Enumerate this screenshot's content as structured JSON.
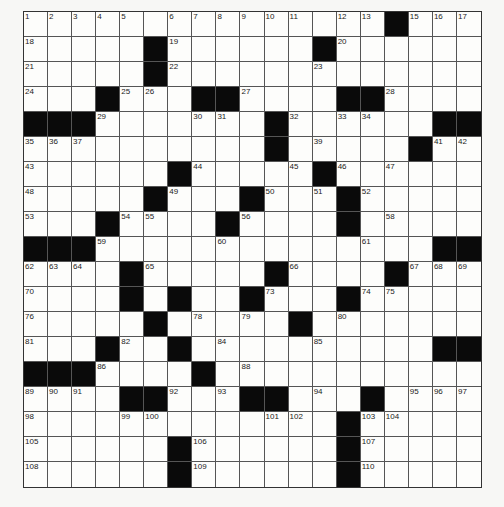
{
  "puzzle": {
    "cols": 19,
    "rows": 19,
    "grid": [
      "...............#...",
      ".....#......#......",
      ".....#.............",
      "...#...##....##....",
      "###.......#......##",
      "..........#.....#..",
      "......#.....#......",
      ".....#...#...#.....",
      "...#....#....#.....",
      "###..............##",
      "....#.....#....#...",
      "....#.#..#...#.....",
      ".....#.....#.......",
      "...#..#..........##",
      "###....#...........",
      "....##...##...#....",
      ".............#.....",
      "......#......#.....",
      "......#......#....."
    ],
    "numbers": [
      [
        1,
        0,
        0
      ],
      [
        2,
        0,
        1
      ],
      [
        3,
        0,
        2
      ],
      [
        4,
        0,
        3
      ],
      [
        5,
        0,
        4
      ],
      [
        6,
        0,
        6
      ],
      [
        7,
        0,
        7
      ],
      [
        8,
        0,
        8
      ],
      [
        9,
        0,
        9
      ],
      [
        10,
        0,
        10
      ],
      [
        11,
        0,
        11
      ],
      [
        12,
        0,
        13
      ],
      [
        13,
        0,
        14
      ],
      [
        14,
        0,
        15
      ],
      [
        15,
        0,
        16
      ],
      [
        16,
        0,
        17
      ],
      [
        17,
        0,
        18
      ],
      [
        18,
        1,
        0
      ],
      [
        19,
        1,
        6
      ],
      [
        20,
        1,
        13
      ],
      [
        21,
        2,
        0
      ],
      [
        22,
        2,
        6
      ],
      [
        23,
        2,
        12
      ],
      [
        24,
        3,
        0
      ],
      [
        25,
        3,
        4
      ],
      [
        26,
        3,
        5
      ],
      [
        27,
        3,
        9
      ],
      [
        28,
        3,
        15
      ],
      [
        29,
        4,
        3
      ],
      [
        30,
        4,
        7
      ],
      [
        31,
        4,
        8
      ],
      [
        32,
        4,
        11
      ],
      [
        33,
        4,
        13
      ],
      [
        34,
        4,
        14
      ],
      [
        35,
        5,
        0
      ],
      [
        36,
        5,
        1
      ],
      [
        37,
        5,
        2
      ],
      [
        38,
        5,
        10
      ],
      [
        39,
        5,
        12
      ],
      [
        40,
        5,
        16
      ],
      [
        41,
        5,
        17
      ],
      [
        42,
        5,
        18
      ],
      [
        43,
        6,
        0
      ],
      [
        44,
        6,
        7
      ],
      [
        45,
        6,
        11
      ],
      [
        46,
        6,
        13
      ],
      [
        47,
        6,
        15
      ],
      [
        48,
        7,
        0
      ],
      [
        49,
        7,
        6
      ],
      [
        50,
        7,
        10
      ],
      [
        51,
        7,
        12
      ],
      [
        52,
        7,
        14
      ],
      [
        53,
        8,
        0
      ],
      [
        54,
        8,
        4
      ],
      [
        55,
        8,
        5
      ],
      [
        56,
        8,
        9
      ],
      [
        57,
        8,
        13
      ],
      [
        58,
        8,
        15
      ],
      [
        59,
        9,
        3
      ],
      [
        60,
        9,
        8
      ],
      [
        61,
        9,
        14
      ],
      [
        62,
        10,
        0
      ],
      [
        63,
        10,
        1
      ],
      [
        64,
        10,
        2
      ],
      [
        65,
        10,
        5
      ],
      [
        66,
        10,
        11
      ],
      [
        67,
        10,
        16
      ],
      [
        68,
        10,
        17
      ],
      [
        69,
        10,
        18
      ],
      [
        70,
        11,
        0
      ],
      [
        71,
        11,
        4
      ],
      [
        72,
        11,
        6
      ],
      [
        73,
        11,
        10
      ],
      [
        74,
        11,
        14
      ],
      [
        75,
        11,
        15
      ],
      [
        76,
        12,
        0
      ],
      [
        77,
        12,
        5
      ],
      [
        78,
        12,
        7
      ],
      [
        79,
        12,
        9
      ],
      [
        80,
        12,
        13
      ],
      [
        81,
        13,
        0
      ],
      [
        82,
        13,
        4
      ],
      [
        83,
        13,
        6
      ],
      [
        84,
        13,
        8
      ],
      [
        85,
        13,
        12
      ],
      [
        86,
        14,
        3
      ],
      [
        87,
        14,
        7
      ],
      [
        88,
        14,
        9
      ],
      [
        89,
        15,
        0
      ],
      [
        90,
        15,
        1
      ],
      [
        91,
        15,
        2
      ],
      [
        92,
        15,
        6
      ],
      [
        93,
        15,
        8
      ],
      [
        94,
        15,
        12
      ],
      [
        95,
        15,
        16
      ],
      [
        96,
        15,
        17
      ],
      [
        97,
        15,
        18
      ],
      [
        98,
        16,
        0
      ],
      [
        99,
        16,
        4
      ],
      [
        100,
        16,
        5
      ],
      [
        101,
        16,
        10
      ],
      [
        102,
        16,
        11
      ],
      [
        103,
        16,
        14
      ],
      [
        104,
        16,
        15
      ],
      [
        105,
        17,
        0
      ],
      [
        106,
        17,
        7
      ],
      [
        107,
        17,
        14
      ],
      [
        108,
        18,
        0
      ],
      [
        109,
        18,
        7
      ],
      [
        110,
        18,
        14
      ]
    ]
  }
}
